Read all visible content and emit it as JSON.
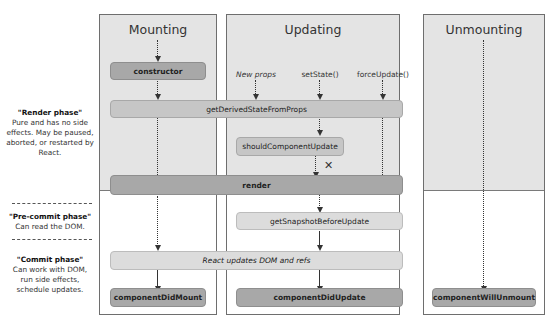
{
  "diagram": {
    "type": "react-lifecycle",
    "columns": [
      {
        "id": "mounting",
        "title": "Mounting"
      },
      {
        "id": "updating",
        "title": "Updating"
      },
      {
        "id": "unmounting",
        "title": "Unmounting"
      }
    ],
    "phases": [
      {
        "id": "render",
        "title": "\"Render phase\"",
        "description": "Pure and has no side effects. May be paused, aborted, or restarted by React."
      },
      {
        "id": "pre-commit",
        "title": "\"Pre-commit phase\"",
        "description": "Can read the DOM."
      },
      {
        "id": "commit",
        "title": "\"Commit phase\"",
        "description": "Can work with DOM, run side effects, schedule updates."
      }
    ],
    "triggers": {
      "new_props": "New props",
      "set_state": "setState()",
      "force_update": "forceUpdate()"
    },
    "nodes": {
      "constructor": "constructor",
      "get_derived_state_from_props": "getDerivedStateFromProps",
      "should_component_update": "shouldComponentUpdate",
      "render": "render",
      "get_snapshot_before_update": "getSnapshotBeforeUpdate",
      "react_updates_dom": "React updates DOM and refs",
      "component_did_mount": "componentDidMount",
      "component_did_update": "componentDidUpdate",
      "component_will_unmount": "componentWillUnmount"
    },
    "skip_marker": "✕",
    "colors": {
      "render_phase_bg": "#e4e4e4",
      "commit_phase_bg": "#ffffff",
      "dark_node": "#a8a8a8",
      "mid_node": "#c6c6c6",
      "light_node": "#dcdcdc"
    }
  }
}
